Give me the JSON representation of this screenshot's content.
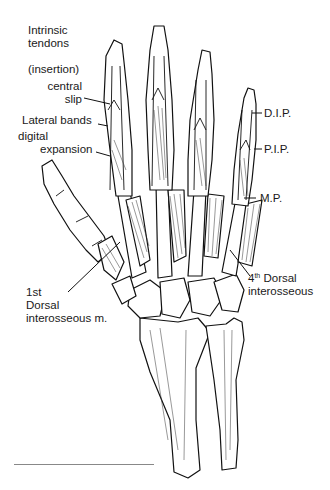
{
  "figure": {
    "labels": {
      "intrinsic_tendons_line1": "Intrinsic",
      "intrinsic_tendons_line2": "tendons",
      "insertion": "(insertion)",
      "central_slip_line1": "central",
      "central_slip_line2": "slip",
      "lateral_bands": "Lateral bands",
      "digital_expansion_line1": "digital",
      "digital_expansion_line2": "expansion",
      "dip": "D.I.P.",
      "pip": "P.I.P.",
      "mp": "M.P.",
      "fourth_dorsal_num": "4",
      "fourth_dorsal_sup": "th",
      "fourth_dorsal_line1_rest": " Dorsal",
      "fourth_dorsal_line2": "interosseous",
      "first_dorsal_line1": "1st",
      "first_dorsal_line2": "Dorsal",
      "first_dorsal_line3": "interosseous m."
    }
  }
}
